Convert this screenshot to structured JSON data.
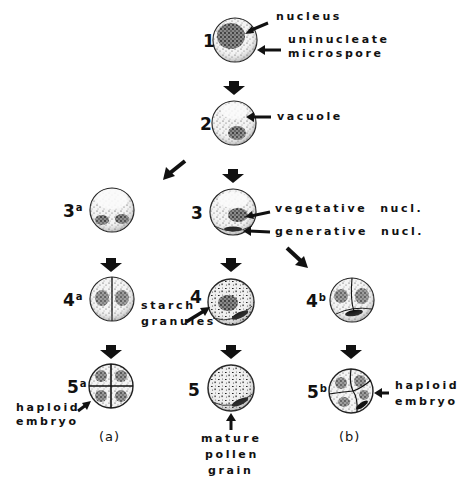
{
  "diagram": {
    "type": "developmental-pathway",
    "stages": [
      {
        "id": "1",
        "label": "1",
        "sup": ""
      },
      {
        "id": "2",
        "label": "2",
        "sup": ""
      },
      {
        "id": "3",
        "label": "3",
        "sup": ""
      },
      {
        "id": "3a",
        "label": "3",
        "sup": "a"
      },
      {
        "id": "4",
        "label": "4",
        "sup": ""
      },
      {
        "id": "4a",
        "label": "4",
        "sup": "a"
      },
      {
        "id": "4b",
        "label": "4",
        "sup": "b"
      },
      {
        "id": "5",
        "label": "5",
        "sup": ""
      },
      {
        "id": "5a",
        "label": "5",
        "sup": "a"
      },
      {
        "id": "5b",
        "label": "5",
        "sup": "b"
      }
    ],
    "annotations": {
      "nucleus": "nucleus",
      "uninucleate": "uninucleate",
      "microspore": "microspore",
      "vacuole": "vacuole",
      "vegetative": "vegetative  nucl.",
      "generative": "generative  nucl.",
      "starch": "starch",
      "granules": "granules",
      "haploid_a": "haploid",
      "embryo_a": "embryo",
      "mature": "mature",
      "pollen": "pollen",
      "grain": "grain",
      "haploid_b": "haploid",
      "embryo_b": "embryo"
    },
    "pathways": {
      "a": "(a)",
      "b": "(b)"
    },
    "edges": [
      [
        "1",
        "2"
      ],
      [
        "2",
        "3"
      ],
      [
        "2",
        "3a"
      ],
      [
        "3",
        "4"
      ],
      [
        "3",
        "4b"
      ],
      [
        "3a",
        "4a"
      ],
      [
        "4",
        "5"
      ],
      [
        "4a",
        "5a"
      ],
      [
        "4b",
        "5b"
      ]
    ],
    "colors": {
      "ink": "#111111",
      "background": "#ffffff"
    }
  }
}
